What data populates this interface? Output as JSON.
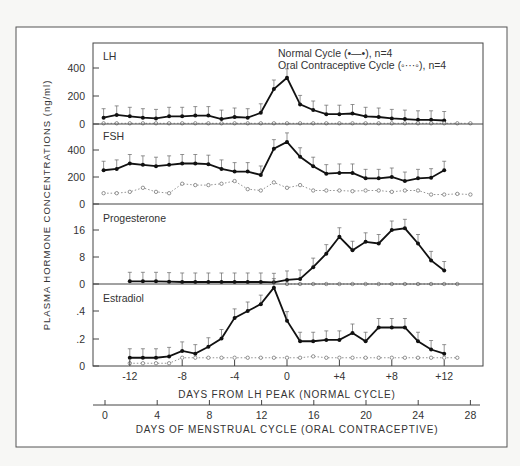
{
  "chart_data": {
    "type": "line",
    "ylabel": "PLASMA HORMONE CONCENTRATIONS (ng/ml)",
    "xlabel_primary": "DAYS FROM LH PEAK (NORMAL CYCLE)",
    "xlabel_secondary": "DAYS OF MENSTRUAL CYCLE (ORAL CONTRACEPTIVE)",
    "x_primary_ticks": [
      "-12",
      "-8",
      "-4",
      "0",
      "+4",
      "+8",
      "+12"
    ],
    "x_primary_values": [
      -12,
      -8,
      -4,
      0,
      4,
      8,
      12
    ],
    "x_secondary_ticks": [
      "0",
      "4",
      "8",
      "12",
      "16",
      "20",
      "24",
      "28"
    ],
    "legend": [
      {
        "label": "Normal Cycle (•—•), n=4",
        "style": "solid-filled"
      },
      {
        "label": "Oral Contraceptive Cycle (◦···◦), n=4",
        "style": "dotted-open"
      }
    ],
    "panels": [
      {
        "name": "LH",
        "yticks": [
          "400",
          "200",
          "0"
        ],
        "ylim": [
          0,
          500
        ],
        "series": [
          {
            "name": "Normal Cycle",
            "x": [
              -14,
              -13,
              -12,
              -11,
              -10,
              -9,
              -8,
              -7,
              -6,
              -5,
              -4,
              -3,
              -2,
              -1,
              0,
              1,
              2,
              3,
              4,
              5,
              6,
              7,
              8,
              9,
              10,
              11,
              12
            ],
            "values": [
              45,
              65,
              55,
              45,
              40,
              55,
              55,
              60,
              60,
              35,
              50,
              45,
              80,
              250,
              330,
              140,
              100,
              70,
              70,
              75,
              55,
              50,
              40,
              35,
              30,
              30,
              25
            ]
          },
          {
            "name": "Oral Contraceptive Cycle",
            "x": [
              -14,
              -13,
              -12,
              -11,
              -10,
              -9,
              -8,
              -7,
              -6,
              -5,
              -4,
              -3,
              -2,
              -1,
              0,
              1,
              2,
              3,
              4,
              5,
              6,
              7,
              8,
              9,
              10,
              11,
              12,
              13,
              14
            ],
            "values": [
              5,
              5,
              5,
              5,
              5,
              5,
              5,
              5,
              5,
              5,
              5,
              5,
              5,
              5,
              5,
              5,
              5,
              5,
              5,
              5,
              5,
              5,
              5,
              5,
              5,
              5,
              5,
              5,
              5
            ]
          }
        ]
      },
      {
        "name": "FSH",
        "yticks": [
          "400",
          "200",
          "0"
        ],
        "ylim": [
          0,
          500
        ],
        "series": [
          {
            "name": "Normal Cycle",
            "x": [
              -14,
              -13,
              -12,
              -11,
              -10,
              -9,
              -8,
              -7,
              -6,
              -5,
              -4,
              -3,
              -2,
              -1,
              0,
              1,
              2,
              3,
              4,
              5,
              6,
              7,
              8,
              9,
              10,
              11,
              12
            ],
            "values": [
              250,
              260,
              300,
              290,
              280,
              290,
              300,
              300,
              295,
              260,
              240,
              240,
              215,
              410,
              460,
              350,
              280,
              225,
              230,
              230,
              190,
              190,
              200,
              170,
              190,
              195,
              250
            ]
          },
          {
            "name": "Oral Contraceptive Cycle",
            "x": [
              -14,
              -13,
              -12,
              -11,
              -10,
              -9,
              -8,
              -7,
              -6,
              -5,
              -4,
              -3,
              -2,
              -1,
              0,
              1,
              2,
              3,
              4,
              5,
              6,
              7,
              8,
              9,
              10,
              11,
              12,
              13,
              14
            ],
            "values": [
              80,
              80,
              90,
              120,
              90,
              80,
              150,
              140,
              140,
              150,
              170,
              110,
              100,
              160,
              120,
              140,
              100,
              100,
              100,
              95,
              100,
              100,
              90,
              100,
              100,
              70,
              70,
              75,
              70
            ]
          }
        ]
      },
      {
        "name": "Progesterone",
        "yticks": [
          "16",
          "8",
          "0"
        ],
        "ylim": [
          0,
          22
        ],
        "series": [
          {
            "name": "Normal Cycle",
            "x": [
              -12,
              -11,
              -10,
              -9,
              -8,
              -7,
              -6,
              -5,
              -4,
              -3,
              -2,
              -1,
              0,
              1,
              2,
              3,
              4,
              5,
              6,
              7,
              8,
              9,
              10,
              11,
              12
            ],
            "values": [
              0.8,
              0.8,
              0.8,
              0.7,
              0.6,
              0.6,
              0.6,
              0.6,
              0.6,
              0.6,
              0.6,
              0.5,
              1.2,
              1.5,
              5,
              9,
              14,
              10,
              12.5,
              12,
              16,
              16.5,
              12,
              7,
              4
            ]
          },
          {
            "name": "Oral Contraceptive Cycle",
            "x": [
              0,
              1,
              2,
              3,
              4,
              5,
              6,
              7,
              8,
              9,
              10,
              11,
              12,
              13
            ],
            "values": [
              0,
              0,
              0,
              0,
              0,
              0,
              0,
              0,
              0,
              0,
              0,
              0,
              0,
              0
            ]
          }
        ]
      },
      {
        "name": "Estradiol",
        "yticks": [
          ".4",
          ".2",
          "0"
        ],
        "ylim": [
          0,
          0.6
        ],
        "series": [
          {
            "name": "Normal Cycle",
            "x": [
              -12,
              -11,
              -10,
              -9,
              -8,
              -7,
              -6,
              -5,
              -4,
              -3,
              -2,
              -1,
              0,
              1,
              2,
              3,
              4,
              5,
              6,
              7,
              8,
              9,
              10,
              11,
              12
            ],
            "values": [
              0.06,
              0.06,
              0.06,
              0.07,
              0.11,
              0.09,
              0.14,
              0.2,
              0.35,
              0.4,
              0.45,
              0.57,
              0.33,
              0.18,
              0.18,
              0.19,
              0.19,
              0.24,
              0.18,
              0.28,
              0.28,
              0.28,
              0.18,
              0.12,
              0.09
            ]
          },
          {
            "name": "Oral Contraceptive Cycle",
            "x": [
              -12,
              -11,
              -10,
              -9,
              -8,
              -7,
              -6,
              -5,
              -4,
              -3,
              -2,
              -1,
              0,
              1,
              2,
              3,
              4,
              5,
              6,
              7,
              8,
              9,
              10,
              11,
              12,
              13
            ],
            "values": [
              0.02,
              0.02,
              0.02,
              0.02,
              0.06,
              0.06,
              0.06,
              0.06,
              0.06,
              0.06,
              0.06,
              0.06,
              0.06,
              0.06,
              0.07,
              0.06,
              0.06,
              0.06,
              0.06,
              0.06,
              0.06,
              0.06,
              0.06,
              0.06,
              0.06,
              0.06
            ]
          }
        ]
      }
    ]
  }
}
